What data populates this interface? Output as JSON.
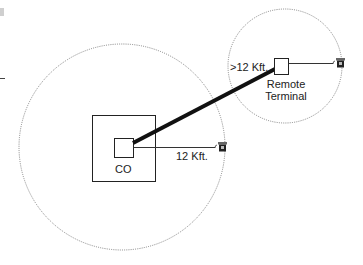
{
  "diagram": {
    "labels": {
      "co": "CO",
      "remote_line1": "Remote",
      "remote_line2": "Terminal",
      "short_loop": "12 Kft.",
      "long_loop": ">12 Kft."
    },
    "icons": {
      "phone_co": "telephone-icon",
      "phone_remote": "telephone-icon"
    },
    "colors": {
      "line": "#111111",
      "circle": "#777777",
      "background": "#ffffff"
    }
  }
}
